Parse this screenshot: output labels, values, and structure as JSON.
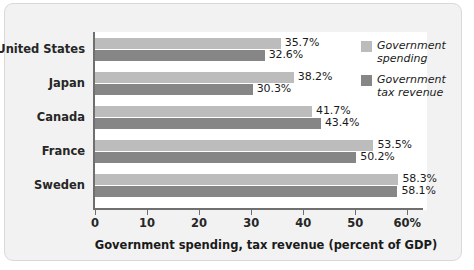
{
  "chart_data": {
    "type": "bar",
    "orientation": "horizontal",
    "title": "",
    "xlabel": "Government spending, tax revenue (percent of GDP)",
    "ylabel": "",
    "xlim": [
      0,
      60
    ],
    "grid": false,
    "legend_position": "top-right",
    "categories": [
      "United States",
      "Japan",
      "Canada",
      "France",
      "Sweden"
    ],
    "xticks": [
      {
        "value": 0,
        "label": "0"
      },
      {
        "value": 10,
        "label": "10"
      },
      {
        "value": 20,
        "label": "20"
      },
      {
        "value": 30,
        "label": "30"
      },
      {
        "value": 40,
        "label": "40"
      },
      {
        "value": 50,
        "label": "50"
      },
      {
        "value": 60,
        "label": "60%"
      }
    ],
    "series": [
      {
        "name": "Government spending",
        "color": "#bcbcbc",
        "values": [
          35.7,
          38.2,
          41.7,
          53.5,
          58.3
        ],
        "labels": [
          "35.7%",
          "38.2%",
          "41.7%",
          "53.5%",
          "58.3%"
        ]
      },
      {
        "name": "Government tax revenue",
        "color": "#868686",
        "values": [
          32.6,
          30.3,
          43.4,
          50.2,
          58.1
        ],
        "labels": [
          "32.6%",
          "30.3%",
          "43.4%",
          "50.2%",
          "58.1%"
        ]
      }
    ],
    "legend": [
      {
        "label": "Government\nspending",
        "color": "#bcbcbc"
      },
      {
        "label": "Government\ntax revenue",
        "color": "#868686"
      }
    ]
  },
  "colors": {
    "spending": "#bcbcbc",
    "tax_revenue": "#868686",
    "axis": "#6f6f6f",
    "card_background": "#f2f2f2",
    "plot_background": "#ffffff",
    "text": "#1a1a1a"
  }
}
